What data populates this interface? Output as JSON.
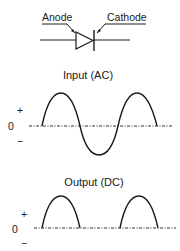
{
  "diode": {
    "anode_label": "Anode",
    "cathode_label": "Cathode"
  },
  "input_plot": {
    "title": "Input (AC)",
    "plus_label": "+",
    "zero_label": "0",
    "minus_label": "−"
  },
  "output_plot": {
    "title": "Output (DC)",
    "plus_label": "+",
    "zero_label": "0",
    "minus_label": "−"
  },
  "colors": {
    "stroke": "#1a1a1a",
    "background": "#ffffff"
  }
}
